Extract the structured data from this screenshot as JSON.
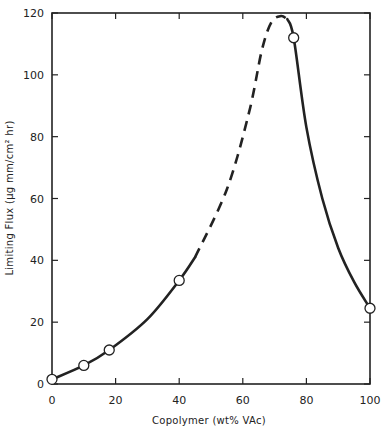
{
  "chart_data": {
    "type": "line",
    "title": "",
    "xlabel": "Copolymer (wt% VAc)",
    "ylabel": "Limiting Flux  (μg mm/cm² hr)",
    "xlim": [
      0,
      100
    ],
    "ylim": [
      0,
      120
    ],
    "x_ticks": [
      0,
      20,
      40,
      60,
      80,
      100
    ],
    "y_ticks": [
      0,
      20,
      40,
      60,
      80,
      100,
      120
    ],
    "x_tick_labels": [
      "0",
      "20",
      "40",
      "60",
      "80",
      "100"
    ],
    "y_tick_labels": [
      "0",
      "20",
      "40",
      "60",
      "80",
      "100",
      "120"
    ],
    "grid": false,
    "legend": null,
    "series": [
      {
        "name": "Measured",
        "marker": "open-circle",
        "x": [
          0,
          10,
          18,
          40,
          76,
          100
        ],
        "y": [
          1.5,
          6,
          11,
          33.5,
          112,
          24.5
        ]
      }
    ],
    "curve": {
      "solid_segments": [
        {
          "x": [
            0,
            10,
            18,
            30,
            40,
            45
          ],
          "y": [
            1.5,
            6,
            11,
            21,
            33.5,
            41
          ]
        },
        {
          "x": [
            74,
            76,
            80,
            85,
            90,
            95,
            100
          ],
          "y": [
            118,
            112,
            83,
            60,
            44,
            33,
            24.5
          ]
        }
      ],
      "dashed_segment": {
        "x": [
          45,
          55,
          62,
          66,
          69,
          72,
          74
        ],
        "y": [
          41,
          63,
          88,
          108,
          117,
          119,
          118
        ]
      },
      "peak": {
        "x": 71,
        "y": 120
      }
    },
    "color": "#222222"
  }
}
